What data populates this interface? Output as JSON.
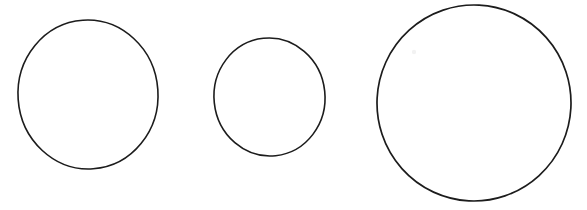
{
  "figure": {
    "kind": "hand-drawn-line-drawing",
    "background_color": "#ffffff",
    "stroke_color": "#1c1c1c",
    "canvas": {
      "width": 587,
      "height": 210
    },
    "shape_count": 3,
    "shapes": [
      {
        "name": "circle-left",
        "shape": "circle",
        "order_label": "1",
        "size_label": "medium",
        "center_x": 88,
        "center_y": 94.5,
        "radius_x": 70,
        "radius_y": 74.5,
        "width": 140,
        "height": 149,
        "bbox": {
          "left": 18,
          "top": 20,
          "right": 158,
          "bottom": 169
        },
        "stroke_width": 1.6,
        "rotation": -4,
        "fill": "none"
      },
      {
        "name": "circle-middle",
        "shape": "circle",
        "order_label": "2",
        "size_label": "small",
        "center_x": 269.5,
        "center_y": 97,
        "radius_x": 55.5,
        "radius_y": 59,
        "width": 111,
        "height": 118,
        "bbox": {
          "left": 214,
          "top": 38,
          "right": 325,
          "bottom": 156
        },
        "stroke_width": 1.6,
        "rotation": -6,
        "fill": "none"
      },
      {
        "name": "circle-right",
        "shape": "circle",
        "order_label": "3",
        "size_label": "large",
        "center_x": 474,
        "center_y": 103,
        "radius_x": 97,
        "radius_y": 98,
        "width": 194,
        "height": 196,
        "bbox": {
          "left": 377,
          "top": 5,
          "right": 571,
          "bottom": 201
        },
        "stroke_width": 1.7,
        "rotation": 3,
        "fill": "none"
      }
    ],
    "artifacts": [
      {
        "name": "faint-smudge",
        "center_x": 414,
        "center_y": 52,
        "radius": 2.2,
        "color": "#f2f2f2"
      }
    ]
  }
}
